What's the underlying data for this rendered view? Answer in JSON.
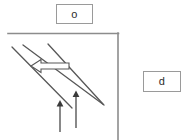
{
  "diagram": {
    "background_color": "#ffffff",
    "stroke_color": "#585858",
    "frame_color": "#8c8c8c",
    "box_border_color": "#9a9a9a",
    "text_color": "#2b2b2b",
    "labels": {
      "top_box_text": "o",
      "right_box_text": "d"
    },
    "frame": {
      "top_line": {
        "x1": 8,
        "y1": 33,
        "x2": 119,
        "y2": 33
      },
      "right_line": {
        "x1": 118,
        "y1": 33,
        "x2": 118,
        "y2": 140
      }
    },
    "diagonal_lines": [
      {
        "name": "descending-line-upper",
        "x1": 12,
        "y1": 47,
        "x2": 72,
        "y2": 108
      },
      {
        "name": "descending-line-lower",
        "x1": 23,
        "y1": 45,
        "x2": 104,
        "y2": 105
      },
      {
        "name": "ascending-line",
        "x1": 48,
        "y1": 44,
        "x2": 103,
        "y2": 104
      }
    ],
    "hollow_arrow": {
      "name": "hollow-left-arrow",
      "direction": "left",
      "tip_x": 31,
      "tip_y": 66,
      "tail_x": 69,
      "tail_y": 66
    },
    "up_arrows": [
      {
        "name": "up-arrow-left",
        "x": 60,
        "y_tip": 102,
        "y_tail": 132
      },
      {
        "name": "up-arrow-right",
        "x": 76,
        "y_tip": 92,
        "y_tail": 128
      }
    ]
  }
}
